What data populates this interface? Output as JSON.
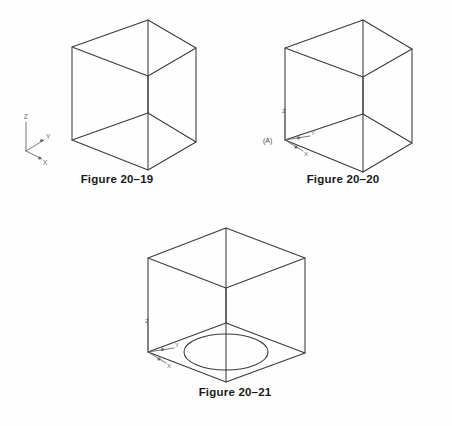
{
  "page": {
    "background_color": "#fefefe",
    "line_color": "#3a3a3a",
    "caption_color": "#1a1a1a"
  },
  "figures": [
    {
      "id": "figure-20-19",
      "caption": "Figure 20–19",
      "description": "Isometric wireframe cube, open box view",
      "axis_indicator": {
        "present": true,
        "attached_to_cube": false,
        "origin_label": "",
        "labels": {
          "z": "Z",
          "y": "Y",
          "x": "X"
        }
      },
      "circle_on_bottom_face": false
    },
    {
      "id": "figure-20-20",
      "caption": "Figure 20–20",
      "description": "Isometric wireframe cube with user coordinate system at corner A",
      "axis_indicator": {
        "present": true,
        "attached_to_cube": true,
        "origin_label": "(A)",
        "labels": {
          "z": "Z",
          "y": "Y",
          "x": "X"
        }
      },
      "circle_on_bottom_face": false
    },
    {
      "id": "figure-20-21",
      "caption": "Figure 20–21",
      "description": "Isometric wireframe cube with circle drawn on bottom face",
      "axis_indicator": {
        "present": true,
        "attached_to_cube": true,
        "origin_label": "",
        "labels": {
          "z": "Z",
          "y": "Y",
          "x": "X"
        }
      },
      "circle_on_bottom_face": true
    }
  ]
}
